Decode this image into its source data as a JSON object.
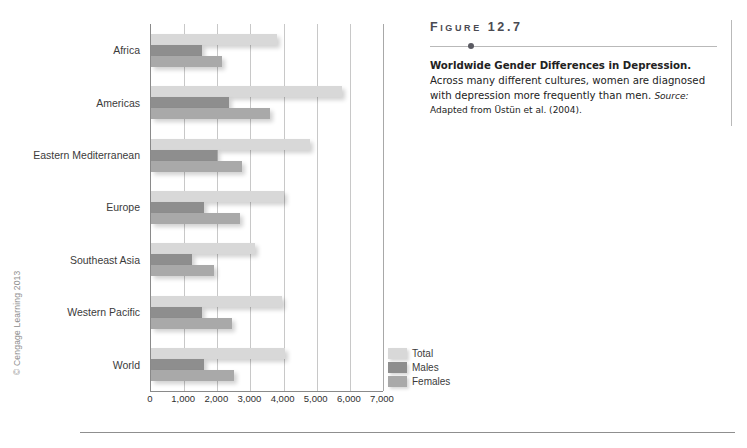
{
  "copyright": "© Cengage Learning 2013",
  "figure": {
    "number": "Figure 12.7",
    "caption_title": "Worldwide Gender Differences in Depression.",
    "caption_body": "Across many different cultures, women are diagnosed with depression more frequently than men.",
    "source_label": "Source:",
    "source_text": "Adapted from Üstün et al. (2004)."
  },
  "legend": {
    "items": [
      {
        "label": "Total",
        "key": "total",
        "color": "#d8d8d8"
      },
      {
        "label": "Males",
        "key": "males",
        "color": "#8e8e8e"
      },
      {
        "label": "Females",
        "key": "females",
        "color": "#a9a9a9"
      }
    ]
  },
  "chart_data": {
    "type": "bar",
    "orientation": "horizontal",
    "title": "",
    "xlabel": "",
    "ylabel": "",
    "xlim": [
      0,
      7000
    ],
    "xticks": [
      0,
      1000,
      2000,
      3000,
      4000,
      5000,
      6000,
      7000
    ],
    "xtick_labels": [
      "0",
      "1,000",
      "2,000",
      "3,000",
      "4,000",
      "5,000",
      "6,000",
      "7,000"
    ],
    "grid": true,
    "grid_axis": "x",
    "legend_position": "right-bottom",
    "categories": [
      "Africa",
      "Americas",
      "Eastern Mediterranean",
      "Europe",
      "Southeast Asia",
      "Western Pacific",
      "World"
    ],
    "series": [
      {
        "name": "Total",
        "color": "#d8d8d8",
        "values": [
          3800,
          5750,
          4800,
          4000,
          3150,
          3950,
          4050
        ]
      },
      {
        "name": "Males",
        "color": "#8e8e8e",
        "values": [
          1550,
          2350,
          2000,
          1600,
          1250,
          1550,
          1600
        ]
      },
      {
        "name": "Females",
        "color": "#a9a9a9",
        "values": [
          2150,
          3600,
          2750,
          2700,
          1900,
          2450,
          2500
        ]
      }
    ]
  }
}
